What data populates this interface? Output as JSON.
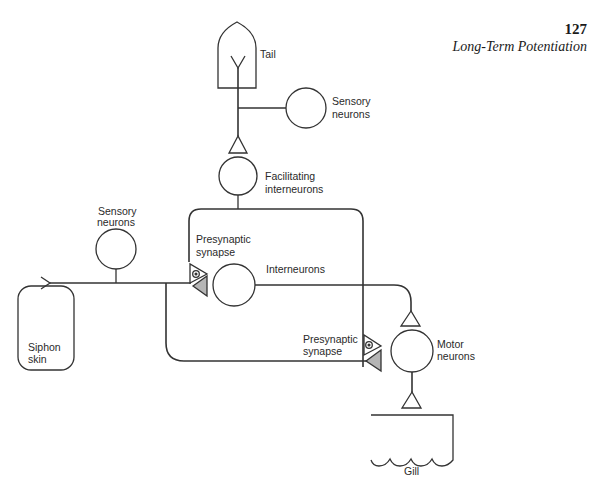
{
  "header": {
    "page_number": "127",
    "running_title": "Long-Term Potentiation"
  },
  "diagram": {
    "labels": {
      "tail": "Tail",
      "sensory_neurons_tail_1": "Sensory",
      "sensory_neurons_tail_2": "neurons",
      "facilitating_1": "Facilitating",
      "facilitating_2": "interneurons",
      "sensory_neurons_siphon_1": "Sensory",
      "sensory_neurons_siphon_2": "neurons",
      "presynaptic_upper_1": "Presynaptic",
      "presynaptic_upper_2": "synapse",
      "interneurons": "Interneurons",
      "siphon_skin_1": "Siphon",
      "siphon_skin_2": "skin",
      "presynaptic_lower_1": "Presynaptic",
      "presynaptic_lower_2": "synapse",
      "motor_neurons_1": "Motor",
      "motor_neurons_2": "neurons",
      "gill": "Gill"
    },
    "colors": {
      "stroke": "#333333",
      "synapse_fill": "#b5b5b5"
    }
  }
}
